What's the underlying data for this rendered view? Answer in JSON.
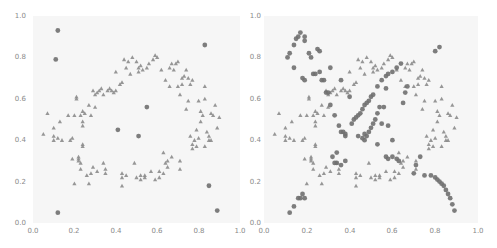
{
  "chart_data": [
    {
      "type": "scatter",
      "title": "",
      "xlabel": "",
      "ylabel": "",
      "xlim": [
        0.0,
        1.0
      ],
      "ylim": [
        0.0,
        1.0
      ],
      "grid": false,
      "legend": null,
      "x_ticks": [
        "0.0",
        "0.2",
        "0.4",
        "0.6",
        "0.8",
        "1.0"
      ],
      "y_ticks": [
        "0.0",
        "0.2",
        "0.4",
        "0.6",
        "0.8",
        "1.0"
      ],
      "series": [
        {
          "name": "inliers",
          "marker": "triangle",
          "color": "#8c8c8c",
          "points": [
            [
              0.05,
              0.43
            ],
            [
              0.07,
              0.53
            ],
            [
              0.1,
              0.46
            ],
            [
              0.1,
              0.42
            ],
            [
              0.1,
              0.4
            ],
            [
              0.12,
              0.41
            ],
            [
              0.13,
              0.49
            ],
            [
              0.14,
              0.4
            ],
            [
              0.17,
              0.52
            ],
            [
              0.18,
              0.4
            ],
            [
              0.19,
              0.41
            ],
            [
              0.19,
              0.31
            ],
            [
              0.2,
              0.19
            ],
            [
              0.2,
              0.52
            ],
            [
              0.21,
              0.61
            ],
            [
              0.21,
              0.6
            ],
            [
              0.22,
              0.31
            ],
            [
              0.22,
              0.3
            ],
            [
              0.22,
              0.32
            ],
            [
              0.23,
              0.26
            ],
            [
              0.23,
              0.29
            ],
            [
              0.23,
              0.52
            ],
            [
              0.24,
              0.54
            ],
            [
              0.24,
              0.47
            ],
            [
              0.24,
              0.49
            ],
            [
              0.24,
              0.37
            ],
            [
              0.24,
              0.38
            ],
            [
              0.25,
              0.53
            ],
            [
              0.26,
              0.23
            ],
            [
              0.27,
              0.57
            ],
            [
              0.27,
              0.19
            ],
            [
              0.28,
              0.52
            ],
            [
              0.28,
              0.24
            ],
            [
              0.29,
              0.64
            ],
            [
              0.29,
              0.27
            ],
            [
              0.3,
              0.62
            ],
            [
              0.3,
              0.56
            ],
            [
              0.31,
              0.63
            ],
            [
              0.31,
              0.25
            ],
            [
              0.32,
              0.64
            ],
            [
              0.33,
              0.65
            ],
            [
              0.34,
              0.29
            ],
            [
              0.34,
              0.62
            ],
            [
              0.35,
              0.24
            ],
            [
              0.35,
              0.26
            ],
            [
              0.36,
              0.64
            ],
            [
              0.37,
              0.65
            ],
            [
              0.38,
              0.64
            ],
            [
              0.39,
              0.63
            ],
            [
              0.4,
              0.64
            ],
            [
              0.4,
              0.73
            ],
            [
              0.42,
              0.67
            ],
            [
              0.43,
              0.68
            ],
            [
              0.43,
              0.24
            ],
            [
              0.43,
              0.22
            ],
            [
              0.43,
              0.18
            ],
            [
              0.44,
              0.79
            ],
            [
              0.45,
              0.23
            ],
            [
              0.45,
              0.75
            ],
            [
              0.46,
              0.78
            ],
            [
              0.47,
              0.72
            ],
            [
              0.48,
              0.8
            ],
            [
              0.49,
              0.29
            ],
            [
              0.5,
              0.22
            ],
            [
              0.5,
              0.78
            ],
            [
              0.51,
              0.73
            ],
            [
              0.51,
              0.75
            ],
            [
              0.52,
              0.21
            ],
            [
              0.52,
              0.23
            ],
            [
              0.52,
              0.76
            ],
            [
              0.53,
              0.74
            ],
            [
              0.54,
              0.23
            ],
            [
              0.54,
              0.22
            ],
            [
              0.55,
              0.75
            ],
            [
              0.56,
              0.77
            ],
            [
              0.57,
              0.25
            ],
            [
              0.58,
              0.79
            ],
            [
              0.59,
              0.21
            ],
            [
              0.59,
              0.81
            ],
            [
              0.6,
              0.8
            ],
            [
              0.61,
              0.25
            ],
            [
              0.61,
              0.22
            ],
            [
              0.62,
              0.74
            ],
            [
              0.63,
              0.24
            ],
            [
              0.63,
              0.34
            ],
            [
              0.64,
              0.29
            ],
            [
              0.64,
              0.69
            ],
            [
              0.65,
              0.3
            ],
            [
              0.65,
              0.27
            ],
            [
              0.66,
              0.75
            ],
            [
              0.66,
              0.66
            ],
            [
              0.67,
              0.77
            ],
            [
              0.67,
              0.32
            ],
            [
              0.68,
              0.74
            ],
            [
              0.69,
              0.77
            ],
            [
              0.7,
              0.66
            ],
            [
              0.7,
              0.78
            ],
            [
              0.71,
              0.3
            ],
            [
              0.71,
              0.26
            ],
            [
              0.71,
              0.62
            ],
            [
              0.72,
              0.7
            ],
            [
              0.72,
              0.67
            ],
            [
              0.73,
              0.71
            ],
            [
              0.74,
              0.55
            ],
            [
              0.74,
              0.74
            ],
            [
              0.75,
              0.59
            ],
            [
              0.75,
              0.7
            ],
            [
              0.76,
              0.67
            ],
            [
              0.76,
              0.42
            ],
            [
              0.77,
              0.38
            ],
            [
              0.77,
              0.36
            ],
            [
              0.77,
              0.69
            ],
            [
              0.78,
              0.4
            ],
            [
              0.79,
              0.45
            ],
            [
              0.79,
              0.37
            ],
            [
              0.8,
              0.59
            ],
            [
              0.8,
              0.41
            ],
            [
              0.81,
              0.54
            ],
            [
              0.81,
              0.49
            ],
            [
              0.82,
              0.52
            ],
            [
              0.83,
              0.6
            ],
            [
              0.83,
              0.66
            ],
            [
              0.83,
              0.37
            ],
            [
              0.84,
              0.44
            ],
            [
              0.85,
              0.42
            ],
            [
              0.85,
              0.4
            ],
            [
              0.86,
              0.4
            ],
            [
              0.86,
              0.53
            ],
            [
              0.87,
              0.52
            ],
            [
              0.88,
              0.57
            ],
            [
              0.89,
              0.46
            ],
            [
              0.9,
              0.51
            ]
          ]
        },
        {
          "name": "outliers",
          "marker": "circle",
          "color": "#707070",
          "points": [
            [
              0.12,
              0.93
            ],
            [
              0.11,
              0.79
            ],
            [
              0.83,
              0.86
            ],
            [
              0.55,
              0.56
            ],
            [
              0.41,
              0.45
            ],
            [
              0.51,
              0.42
            ],
            [
              0.85,
              0.18
            ],
            [
              0.89,
              0.06
            ],
            [
              0.12,
              0.05
            ]
          ]
        }
      ]
    },
    {
      "type": "scatter",
      "title": "",
      "xlabel": "",
      "ylabel": "",
      "xlim": [
        0.0,
        1.0
      ],
      "ylim": [
        0.0,
        1.0
      ],
      "grid": false,
      "legend": null,
      "x_ticks": [
        "0.0",
        "0.2",
        "0.4",
        "0.6",
        "0.8",
        "1.0"
      ],
      "y_ticks": [
        "0.0",
        "0.2",
        "0.4",
        "0.6",
        "0.8",
        "1.0"
      ],
      "series": [
        {
          "name": "inliers",
          "marker": "triangle",
          "color": "#8c8c8c",
          "points": "same as panel 1 inliers"
        },
        {
          "name": "outliers",
          "marker": "circle",
          "color": "#707070",
          "points": [
            [
              0.12,
              0.05
            ],
            [
              0.14,
              0.08
            ],
            [
              0.16,
              0.12
            ],
            [
              0.17,
              0.12
            ],
            [
              0.18,
              0.14
            ],
            [
              0.19,
              0.12
            ],
            [
              0.11,
              0.8
            ],
            [
              0.12,
              0.82
            ],
            [
              0.14,
              0.75
            ],
            [
              0.14,
              0.86
            ],
            [
              0.15,
              0.89
            ],
            [
              0.16,
              0.9
            ],
            [
              0.17,
              0.92
            ],
            [
              0.19,
              0.88
            ],
            [
              0.19,
              0.9
            ],
            [
              0.18,
              0.7
            ],
            [
              0.19,
              0.69
            ],
            [
              0.21,
              0.82
            ],
            [
              0.22,
              0.8
            ],
            [
              0.23,
              0.72
            ],
            [
              0.24,
              0.72
            ],
            [
              0.25,
              0.84
            ],
            [
              0.26,
              0.73
            ],
            [
              0.26,
              0.83
            ],
            [
              0.27,
              0.69
            ],
            [
              0.28,
              0.69
            ],
            [
              0.29,
              0.63
            ],
            [
              0.3,
              0.63
            ],
            [
              0.31,
              0.57
            ],
            [
              0.33,
              0.52
            ],
            [
              0.35,
              0.47
            ],
            [
              0.36,
              0.44
            ],
            [
              0.37,
              0.44
            ],
            [
              0.38,
              0.43
            ],
            [
              0.38,
              0.42
            ],
            [
              0.31,
              0.75
            ],
            [
              0.36,
              0.69
            ],
            [
              0.4,
              0.61
            ],
            [
              0.41,
              0.48
            ],
            [
              0.42,
              0.5
            ],
            [
              0.43,
              0.51
            ],
            [
              0.44,
              0.52
            ],
            [
              0.45,
              0.53
            ],
            [
              0.46,
              0.55
            ],
            [
              0.47,
              0.57
            ],
            [
              0.48,
              0.58
            ],
            [
              0.49,
              0.59
            ],
            [
              0.5,
              0.61
            ],
            [
              0.51,
              0.62
            ],
            [
              0.53,
              0.66
            ],
            [
              0.55,
              0.69
            ],
            [
              0.57,
              0.71
            ],
            [
              0.58,
              0.72
            ],
            [
              0.6,
              0.73
            ],
            [
              0.62,
              0.75
            ],
            [
              0.64,
              0.77
            ],
            [
              0.47,
              0.4
            ],
            [
              0.48,
              0.42
            ],
            [
              0.49,
              0.44
            ],
            [
              0.5,
              0.46
            ],
            [
              0.51,
              0.48
            ],
            [
              0.52,
              0.5
            ],
            [
              0.53,
              0.53
            ],
            [
              0.54,
              0.56
            ],
            [
              0.44,
              0.42
            ],
            [
              0.46,
              0.41
            ],
            [
              0.47,
              0.43
            ],
            [
              0.53,
              0.38
            ],
            [
              0.57,
              0.32
            ],
            [
              0.58,
              0.31
            ],
            [
              0.6,
              0.32
            ],
            [
              0.62,
              0.31
            ],
            [
              0.63,
              0.3
            ],
            [
              0.32,
              0.32
            ],
            [
              0.33,
              0.29
            ],
            [
              0.34,
              0.29
            ],
            [
              0.36,
              0.28
            ],
            [
              0.34,
              0.34
            ],
            [
              0.38,
              0.3
            ],
            [
              0.55,
              0.48
            ],
            [
              0.56,
              0.56
            ],
            [
              0.57,
              0.65
            ],
            [
              0.58,
              0.47
            ],
            [
              0.6,
              0.4
            ],
            [
              0.65,
              0.58
            ],
            [
              0.66,
              0.63
            ],
            [
              0.67,
              0.66
            ],
            [
              0.7,
              0.24
            ],
            [
              0.71,
              0.28
            ],
            [
              0.73,
              0.32
            ],
            [
              0.75,
              0.23
            ],
            [
              0.78,
              0.23
            ],
            [
              0.8,
              0.22
            ],
            [
              0.81,
              0.21
            ],
            [
              0.82,
              0.2
            ],
            [
              0.83,
              0.19
            ],
            [
              0.84,
              0.18
            ],
            [
              0.85,
              0.16
            ],
            [
              0.86,
              0.14
            ],
            [
              0.87,
              0.12
            ],
            [
              0.88,
              0.09
            ],
            [
              0.89,
              0.06
            ],
            [
              0.8,
              0.83
            ],
            [
              0.82,
              0.85
            ]
          ]
        }
      ]
    }
  ],
  "panels": [
    {
      "name": "left",
      "x_ticks": [
        "0.0",
        "0.2",
        "0.4",
        "0.6",
        "0.8",
        "1.0"
      ],
      "y_ticks": [
        "1.0",
        "0.8",
        "0.6",
        "0.4",
        "0.2",
        "0.0"
      ]
    },
    {
      "name": "right",
      "x_ticks": [
        "0.0",
        "0.2",
        "0.4",
        "0.6",
        "0.8",
        "1.0"
      ],
      "y_ticks": [
        "1.0",
        "0.8",
        "0.6",
        "0.4",
        "0.2",
        "0.0"
      ]
    }
  ],
  "colors": {
    "background": "#ffffff",
    "plot_background": "#f6f6f6",
    "triangle": "#8c8c8c",
    "circle": "#707070",
    "tick_text": "#8a8a8a"
  }
}
